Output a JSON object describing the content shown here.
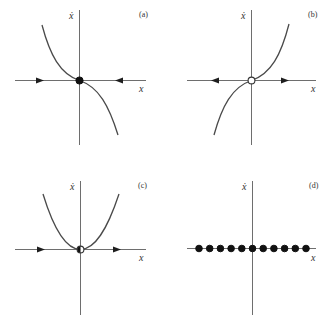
{
  "figure": {
    "colors": {
      "axis": "#6e6e6e",
      "curve": "#4a4a4a",
      "stable_point": "#111111",
      "unstable_point_fill": "#ffffff",
      "background": "#ffffff"
    },
    "panels": [
      {
        "id": "a",
        "label": "(a)",
        "y_axis_label": "ẋ",
        "x_axis_label": "x",
        "curve": "-x^3",
        "fixed_point_type": "stable",
        "flow_arrows": [
          "right",
          "left"
        ]
      },
      {
        "id": "b",
        "label": "(b)",
        "y_axis_label": "ẋ",
        "x_axis_label": "x",
        "curve": "x^3",
        "fixed_point_type": "unstable",
        "flow_arrows": [
          "left",
          "right"
        ]
      },
      {
        "id": "c",
        "label": "(c)",
        "y_axis_label": "ẋ",
        "x_axis_label": "x",
        "curve": "x^2",
        "fixed_point_type": "half-stable",
        "flow_arrows": [
          "right",
          "right"
        ]
      },
      {
        "id": "d",
        "label": "(d)",
        "y_axis_label": "ẋ",
        "x_axis_label": "x",
        "curve": "0",
        "fixed_point_type": "line-of-fixed-points",
        "fixed_point_count": 11,
        "flow_arrows": []
      }
    ]
  }
}
